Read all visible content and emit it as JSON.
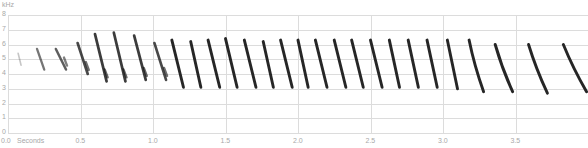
{
  "chart_data": {
    "type": "heatmap",
    "title": "",
    "subtitle": "spectrogram",
    "xlabel": "Seconds",
    "ylabel": "kHz",
    "xlim": [
      0.0,
      3.99
    ],
    "ylim": [
      0,
      8
    ],
    "x_ticks": [
      "0.0",
      "0.5",
      "1.0",
      "1.5",
      "2.0",
      "2.5",
      "3.0",
      "3.5"
    ],
    "y_ticks": [
      "0",
      "1",
      "2",
      "3",
      "4",
      "5",
      "6",
      "7",
      "8"
    ],
    "grid": true,
    "colors": {
      "ink": "#1a1a1a",
      "grid": "#dcdcdc",
      "text": "#a8a8a8"
    },
    "notes": [
      {
        "t_start": 0.07,
        "t_end": 0.09,
        "f_start": 5.4,
        "f_end": 4.6,
        "intensity": 0.25
      },
      {
        "t_start": 0.2,
        "t_end": 0.25,
        "f_start": 5.7,
        "f_end": 4.3,
        "intensity": 0.6
      },
      {
        "t_start": 0.33,
        "t_end": 0.4,
        "f_start": 5.7,
        "f_end": 4.3,
        "intensity": 0.7
      },
      {
        "t_start": 0.48,
        "t_end": 0.55,
        "f_start": 6.1,
        "f_end": 4.0,
        "intensity": 0.8
      },
      {
        "t_start": 0.6,
        "t_end": 0.68,
        "f_start": 6.7,
        "f_end": 3.5,
        "intensity": 0.85
      },
      {
        "t_start": 0.73,
        "t_end": 0.81,
        "f_start": 6.8,
        "f_end": 3.5,
        "intensity": 0.85
      },
      {
        "t_start": 0.87,
        "t_end": 0.95,
        "f_start": 6.6,
        "f_end": 3.6,
        "intensity": 0.85
      },
      {
        "t_start": 1.01,
        "t_end": 1.09,
        "f_start": 6.1,
        "f_end": 3.6,
        "intensity": 0.8
      },
      {
        "t_start": 1.13,
        "t_end": 1.21,
        "f_start": 6.3,
        "f_end": 3.1,
        "intensity": 0.95
      },
      {
        "t_start": 1.26,
        "t_end": 1.33,
        "f_start": 6.2,
        "f_end": 3.1,
        "intensity": 0.95
      },
      {
        "t_start": 1.38,
        "t_end": 1.46,
        "f_start": 6.3,
        "f_end": 3.1,
        "intensity": 0.95
      },
      {
        "t_start": 1.5,
        "t_end": 1.58,
        "f_start": 6.4,
        "f_end": 3.1,
        "intensity": 0.95
      },
      {
        "t_start": 1.63,
        "t_end": 1.71,
        "f_start": 6.3,
        "f_end": 3.1,
        "intensity": 0.95
      },
      {
        "t_start": 1.76,
        "t_end": 1.83,
        "f_start": 6.2,
        "f_end": 3.1,
        "intensity": 0.95
      },
      {
        "t_start": 1.88,
        "t_end": 1.96,
        "f_start": 6.3,
        "f_end": 3.1,
        "intensity": 0.95
      },
      {
        "t_start": 2.0,
        "t_end": 2.07,
        "f_start": 6.3,
        "f_end": 3.1,
        "intensity": 0.95
      },
      {
        "t_start": 2.12,
        "t_end": 2.2,
        "f_start": 6.3,
        "f_end": 3.1,
        "intensity": 0.95
      },
      {
        "t_start": 2.25,
        "t_end": 2.33,
        "f_start": 6.3,
        "f_end": 3.1,
        "intensity": 0.95
      },
      {
        "t_start": 2.37,
        "t_end": 2.45,
        "f_start": 6.3,
        "f_end": 3.1,
        "intensity": 0.95
      },
      {
        "t_start": 2.5,
        "t_end": 2.58,
        "f_start": 6.3,
        "f_end": 3.1,
        "intensity": 0.95
      },
      {
        "t_start": 2.63,
        "t_end": 2.7,
        "f_start": 6.3,
        "f_end": 3.1,
        "intensity": 0.95
      },
      {
        "t_start": 2.76,
        "t_end": 2.83,
        "f_start": 6.3,
        "f_end": 3.1,
        "intensity": 0.95
      },
      {
        "t_start": 2.89,
        "t_end": 2.96,
        "f_start": 6.3,
        "f_end": 3.1,
        "intensity": 0.95
      },
      {
        "t_start": 3.03,
        "t_end": 3.1,
        "f_start": 6.3,
        "f_end": 3.0,
        "intensity": 0.95
      },
      {
        "t_start": 3.18,
        "t_end": 3.28,
        "f_start": 6.3,
        "f_end": 2.8,
        "intensity": 0.95
      },
      {
        "t_start": 3.36,
        "t_end": 3.48,
        "f_start": 6.0,
        "f_end": 2.8,
        "intensity": 0.95
      },
      {
        "t_start": 3.59,
        "t_end": 3.72,
        "f_start": 6.0,
        "f_end": 2.7,
        "intensity": 0.95
      },
      {
        "t_start": 3.83,
        "t_end": 3.99,
        "f_start": 6.0,
        "f_end": 2.8,
        "intensity": 0.95
      }
    ]
  }
}
